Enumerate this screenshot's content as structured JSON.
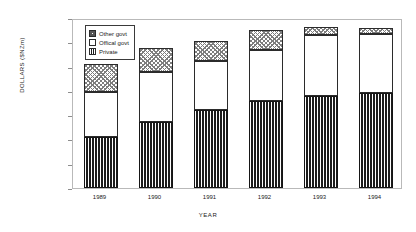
{
  "chart_data": {
    "type": "bar",
    "stacked": true,
    "title": "",
    "xlabel": "YEAR",
    "ylabel": "DOLLARS ($NZm)",
    "categories": [
      "1989",
      "1990",
      "1991",
      "1992",
      "1993",
      "1994"
    ],
    "ylim": [
      0,
      70000
    ],
    "ytick_step": 10000,
    "ytick_labels": [
      "0",
      "10000",
      "20000",
      "30000",
      "40000",
      "50000",
      "60000",
      "70000"
    ],
    "ytick_values": [
      0,
      10000,
      20000,
      30000,
      40000,
      50000,
      60000,
      70000
    ],
    "grid": false,
    "legend_position": "upper-left-inside",
    "series": [
      {
        "name": "Private",
        "pattern": "vertical-stripes",
        "values": [
          21000,
          27000,
          32000,
          36000,
          38000,
          39300
        ]
      },
      {
        "name": "Offical govt",
        "pattern": "solid-white",
        "values": [
          18700,
          20700,
          20300,
          21000,
          25000,
          24000
        ]
      },
      {
        "name": "Other govt",
        "pattern": "checkered",
        "values": [
          11300,
          10000,
          8400,
          8000,
          3200,
          2700
        ]
      }
    ],
    "stack_order_bottom_to_top": [
      "Private",
      "Offical govt",
      "Other govt"
    ],
    "totals": [
      51000,
      57700,
      60700,
      65000,
      66200,
      66000
    ]
  },
  "legend": {
    "entries": [
      {
        "label": "Other govt",
        "swatch": "checkered"
      },
      {
        "label": "Offical govt",
        "swatch": "solid-white"
      },
      {
        "label": "Private",
        "swatch": "vertical-stripes"
      }
    ]
  },
  "axes": {
    "y_title": "DOLLARS ($NZm)",
    "x_title": "YEAR"
  }
}
